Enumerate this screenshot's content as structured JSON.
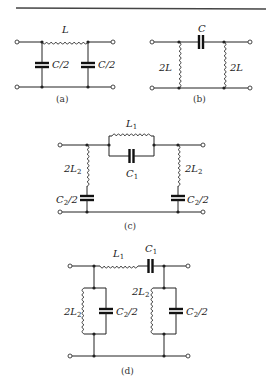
{
  "figure": {
    "top_rule": true,
    "panels": [
      {
        "id": "a",
        "caption": "(a)",
        "components": [
          {
            "type": "inductor",
            "orientation": "series",
            "label": "L"
          },
          {
            "type": "capacitor",
            "orientation": "shunt",
            "position": "left",
            "label": "C/2"
          },
          {
            "type": "capacitor",
            "orientation": "shunt",
            "position": "right",
            "label": "C/2"
          }
        ]
      },
      {
        "id": "b",
        "caption": "(b)",
        "components": [
          {
            "type": "capacitor",
            "orientation": "series",
            "label": "C"
          },
          {
            "type": "inductor",
            "orientation": "shunt",
            "position": "left",
            "label": "2L"
          },
          {
            "type": "inductor",
            "orientation": "shunt",
            "position": "right",
            "label": "2L"
          }
        ]
      },
      {
        "id": "c",
        "caption": "(c)",
        "components": [
          {
            "type": "inductor",
            "orientation": "series-parallel-top",
            "label": "L",
            "sub": "1"
          },
          {
            "type": "capacitor",
            "orientation": "series-parallel-bottom",
            "label": "C",
            "sub": "1"
          },
          {
            "type": "inductor",
            "orientation": "shunt",
            "position": "left",
            "label": "2L",
            "sub": "2"
          },
          {
            "type": "capacitor",
            "orientation": "shunt",
            "position": "left",
            "label": "C",
            "sub": "2",
            "suffix": "/2"
          },
          {
            "type": "inductor",
            "orientation": "shunt",
            "position": "right",
            "label": "2L",
            "sub": "2"
          },
          {
            "type": "capacitor",
            "orientation": "shunt",
            "position": "right",
            "label": "C",
            "sub": "2",
            "suffix": "/2"
          }
        ]
      },
      {
        "id": "d",
        "caption": "(d)",
        "components": [
          {
            "type": "inductor",
            "orientation": "series",
            "label": "L",
            "sub": "1"
          },
          {
            "type": "capacitor",
            "orientation": "series",
            "label": "C",
            "sub": "1"
          },
          {
            "type": "inductor",
            "orientation": "shunt-tank",
            "position": "left",
            "label": "2L",
            "sub": "2"
          },
          {
            "type": "capacitor",
            "orientation": "shunt-tank",
            "position": "left",
            "label": "C",
            "sub": "2",
            "suffix": "/2"
          },
          {
            "type": "inductor",
            "orientation": "shunt-tank",
            "position": "right",
            "label": "2L",
            "sub": "2"
          },
          {
            "type": "capacitor",
            "orientation": "shunt-tank",
            "position": "right",
            "label": "C",
            "sub": "2",
            "suffix": "/2"
          }
        ]
      }
    ]
  }
}
